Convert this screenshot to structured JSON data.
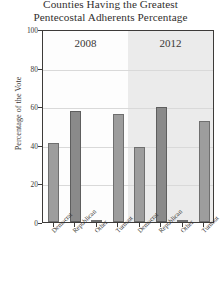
{
  "title": {
    "line1": "Counties Having the Greatest",
    "line2": "Pentecostal Adherents Percentage"
  },
  "axes": {
    "ylabel": "Percentage of the Vote",
    "yticks": [
      "0",
      "20",
      "40",
      "60",
      "80",
      "100"
    ],
    "xlabel": ""
  },
  "panels": [
    {
      "label": "2008"
    },
    {
      "label": "2012"
    }
  ],
  "categories": [
    "Democrat",
    "Republican",
    "Other",
    "Turnout"
  ],
  "colors": {
    "bar_light": "#9d9d9d",
    "bar_dark": "#8a8a8a",
    "bar_edge": "#6f6f6f",
    "panel_2008_bg": "#fdfdfd",
    "panel_2012_bg": "#ebebeb",
    "frame": "#3d3b39",
    "grid": "#d9d9d9",
    "text": "#3a3735"
  },
  "chart_data": {
    "type": "bar",
    "title": "Counties Having the Greatest Pentecostal Adherents Percentage",
    "xlabel": "",
    "ylabel": "Percentage of the Vote",
    "ylim": [
      0,
      100
    ],
    "yticks": [
      0,
      20,
      40,
      60,
      80,
      100
    ],
    "grid": true,
    "legend": "none",
    "panel_variable": "Election Year",
    "categories": [
      "Democrat",
      "Republican",
      "Other",
      "Turnout"
    ],
    "panels": [
      {
        "label": "2008",
        "values": [
          41,
          57.5,
          1,
          56
        ]
      },
      {
        "label": "2012",
        "values": [
          39,
          59.5,
          1,
          52.5
        ]
      }
    ]
  }
}
